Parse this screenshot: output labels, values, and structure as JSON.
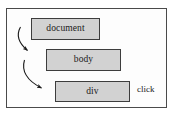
{
  "diagram": {
    "type": "flow-diagram",
    "frame": {
      "name": "outer-container",
      "border_color": "#4a4a4a",
      "background_color": "#fdfdfd"
    },
    "node_fill_color": "#d2d2d2",
    "node_border_color": "#3d3d3d",
    "arrow_color": "#1a1a1a",
    "nodes": [
      {
        "id": "document",
        "label": "document",
        "x": 31,
        "y": 18,
        "width": 69,
        "height": 22
      },
      {
        "id": "body",
        "label": "body",
        "x": 46,
        "y": 49,
        "width": 75,
        "height": 22
      },
      {
        "id": "div",
        "label": "div",
        "x": 55,
        "y": 81,
        "width": 75,
        "height": 21
      }
    ],
    "arrows": [
      {
        "id": "arrow-document-to-body",
        "from": "document",
        "to": "body",
        "style": "curved",
        "head": "filled-triangle"
      },
      {
        "id": "arrow-body-to-div",
        "from": "body",
        "to": "div",
        "style": "curved",
        "head": "filled-triangle"
      }
    ],
    "labels": [
      {
        "id": "click",
        "text": "click",
        "x": 137,
        "y": 85
      }
    ]
  }
}
